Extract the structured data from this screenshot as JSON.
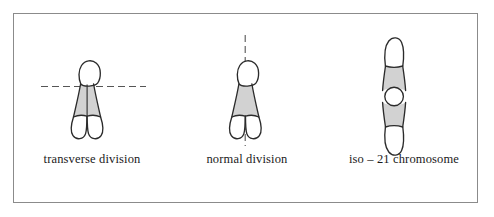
{
  "figure": {
    "background_color": "#ffffff",
    "frame_color": "#8b8b8b",
    "outline_color": "#2b2b2b",
    "shade_color": "#d2d2d2",
    "dash_color": "#555555",
    "panels": [
      {
        "id": "transverse",
        "label": "transverse division",
        "division_axis": "horizontal-dashed",
        "chromosome": {
          "short_arm": "white-rounded-cap",
          "body": "gray-shaded-trapezoid",
          "legs": "two-white-rounded-chromatids",
          "midline": "vertical-solid"
        }
      },
      {
        "id": "normal",
        "label": "normal division",
        "division_axis": "vertical-dashed",
        "chromosome": {
          "short_arm": "white-rounded-cap",
          "body": "gray-shaded-trapezoid",
          "legs": "two-white-rounded-chromatids",
          "midline": "none"
        }
      },
      {
        "id": "iso21",
        "label": "iso – 21 chromosome",
        "division_axis": "none",
        "chromosome": {
          "top_cap": "white-rounded-cap",
          "top_body": "gray-shaded-trapezoid",
          "centromere": "white-circle",
          "bottom_body": "gray-shaded-trapezoid",
          "bottom_cap": "white-rounded-cap"
        }
      }
    ]
  }
}
